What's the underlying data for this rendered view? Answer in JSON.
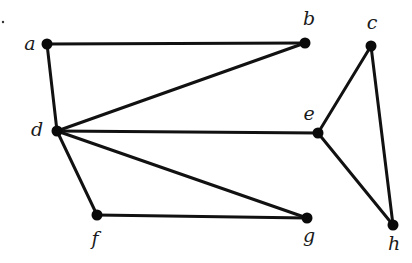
{
  "diagram": {
    "type": "undirected-graph",
    "colors": {
      "edge": "#111111",
      "node": "#0a0a0a",
      "label": "#1a1a1a",
      "background": "#ffffff"
    },
    "nodes": [
      {
        "id": "a",
        "label": "a",
        "x": 47,
        "y": 44,
        "lx": 30,
        "ly": 45
      },
      {
        "id": "b",
        "label": "b",
        "x": 305,
        "y": 43,
        "lx": 309,
        "ly": 20
      },
      {
        "id": "c",
        "label": "c",
        "x": 371,
        "y": 46,
        "lx": 372,
        "ly": 24
      },
      {
        "id": "d",
        "label": "d",
        "x": 57,
        "y": 131,
        "lx": 37,
        "ly": 131
      },
      {
        "id": "e",
        "label": "e",
        "x": 318,
        "y": 133,
        "lx": 309,
        "ly": 115
      },
      {
        "id": "f",
        "label": "f",
        "x": 97,
        "y": 215,
        "lx": 95,
        "ly": 240
      },
      {
        "id": "g",
        "label": "g",
        "x": 307,
        "y": 218,
        "lx": 309,
        "ly": 237
      },
      {
        "id": "h",
        "label": "h",
        "x": 393,
        "y": 225,
        "lx": 394,
        "ly": 245
      }
    ],
    "edges": [
      [
        "a",
        "b"
      ],
      [
        "a",
        "d"
      ],
      [
        "d",
        "b"
      ],
      [
        "d",
        "e"
      ],
      [
        "d",
        "f"
      ],
      [
        "d",
        "g"
      ],
      [
        "f",
        "g"
      ],
      [
        "e",
        "c"
      ],
      [
        "e",
        "h"
      ],
      [
        "c",
        "h"
      ]
    ],
    "stray_mark": {
      "x": 3,
      "y": 22
    }
  }
}
